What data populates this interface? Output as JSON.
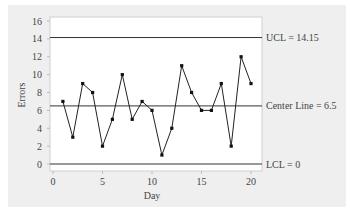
{
  "chart_data": {
    "type": "line",
    "title": "",
    "xlabel": "Day",
    "ylabel": "Errors",
    "x": [
      1,
      2,
      3,
      4,
      5,
      6,
      7,
      8,
      9,
      10,
      11,
      12,
      13,
      14,
      15,
      16,
      17,
      18,
      19,
      20
    ],
    "series": [
      {
        "name": "Errors",
        "values": [
          7,
          3,
          9,
          8,
          2,
          5,
          10,
          5,
          7,
          6,
          1,
          4,
          11,
          8,
          6,
          6,
          9,
          2,
          12,
          9
        ]
      }
    ],
    "xlim": [
      0,
      20
    ],
    "ylim": [
      0,
      16
    ],
    "xticks": [
      0,
      5,
      10,
      15,
      20
    ],
    "yticks": [
      0,
      2,
      4,
      6,
      8,
      10,
      12,
      14,
      16
    ],
    "reference_lines": [
      {
        "label": "UCL = 14.15",
        "value": 14.15
      },
      {
        "label": "Center Line = 6.5",
        "value": 6.5
      },
      {
        "label": "LCL = 0",
        "value": 0
      }
    ],
    "grid": false,
    "legend": "none"
  }
}
